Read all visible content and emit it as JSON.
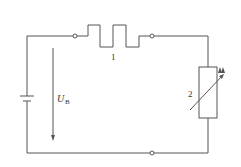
{
  "diagram": {
    "type": "circuit",
    "labels": {
      "heater": "1",
      "thermistor": "2",
      "voltage_symbol": "U",
      "voltage_subscript": "B"
    },
    "components": [
      {
        "id": "1",
        "kind": "heating-element"
      },
      {
        "id": "2",
        "kind": "variable-resistor-light-sensitive"
      },
      {
        "id": "battery",
        "kind": "dc-source"
      }
    ],
    "stroke_color": "#555555"
  }
}
